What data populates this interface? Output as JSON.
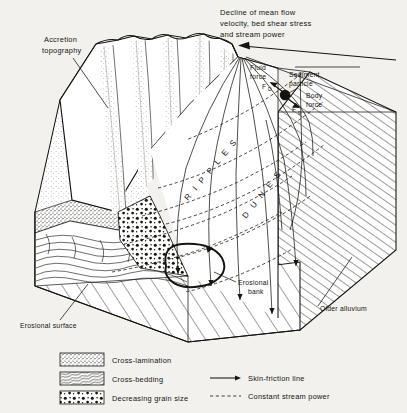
{
  "figure": {
    "kind": "block-diagram",
    "background_color": "#f2f1ee",
    "ink_color": "#15140f"
  },
  "annotations": {
    "top_caption": {
      "line1": "Decline of mean flow",
      "line2": "velocity, bed shear stress",
      "line3": "and  stream  power"
    },
    "accretion": {
      "line1": "Accretion",
      "line2": "topography"
    },
    "fluid_force": {
      "line1": "Fluid",
      "line2": "force",
      "symbol": "F",
      "symbol_sub": "D"
    },
    "sediment_particle": {
      "line1": "Sediment",
      "line2": "particle"
    },
    "body_force": {
      "line1": "Body",
      "line2": "force",
      "symbol": "F",
      "symbol_sub": "g"
    },
    "erosional_bank": {
      "line1": "Erosional",
      "line2": "bank"
    },
    "older_alluvium": "Older  alluvium",
    "erosional_surface": "Erosional  surface",
    "bedform_bands": [
      {
        "id": "ripples",
        "label": "R I P P L E S"
      },
      {
        "id": "dunes",
        "label": "D U N E S"
      }
    ]
  },
  "legend": {
    "swatch_items": [
      {
        "id": "cross-lamination",
        "label": "Cross-lamination",
        "pattern": "dense-stipple-dash"
      },
      {
        "id": "cross-bedding",
        "label": "Cross-bedding",
        "pattern": "wavy-diagonal-lines"
      },
      {
        "id": "decreasing-grain-size",
        "label": "Decreasing  grain  size",
        "pattern": "graded-dots"
      }
    ],
    "line_items": [
      {
        "id": "skin-friction-line",
        "label": "Skin-friction  line",
        "style": "solid-arrow"
      },
      {
        "id": "constant-stream-power",
        "label": "Constant  stream  power",
        "style": "dashed"
      }
    ]
  }
}
